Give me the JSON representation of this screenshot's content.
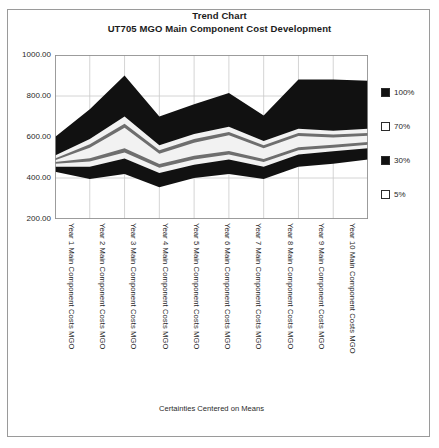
{
  "title": {
    "line1": "Trend Chart",
    "line2": "UT705 MGO Main Component Cost Development"
  },
  "footer": {
    "note": "Certainties Centered on Means"
  },
  "legend": {
    "items": [
      {
        "label": "100%",
        "fill": "#111111",
        "stroke": "#2b2b2b"
      },
      {
        "label": "70%",
        "fill": "#ffffff",
        "stroke": "#2b2b2b"
      },
      {
        "label": "30%",
        "fill": "#111111",
        "stroke": "#2b2b2b"
      },
      {
        "label": "5%",
        "fill": "#ffffff",
        "stroke": "#2b2b2b"
      }
    ]
  },
  "chart_data": {
    "type": "area",
    "subtitle": "Certainties Centered on Means",
    "xlabel": "",
    "ylabel": "",
    "ylim": [
      200.0,
      1000.0
    ],
    "yticks": [
      "1000.00",
      "800.00",
      "600.00",
      "400.00",
      "200.00"
    ],
    "ytick_values": [
      1000.0,
      800.0,
      600.0,
      400.0,
      200.0
    ],
    "grid": true,
    "legend_position": "right",
    "categories": [
      "Year 1 Main Component Costs MGO",
      "Year 2 Main Component Costs MGO",
      "Year 3 Main Component Costs MGO",
      "Year 4 Main Component Costs MGO",
      "Year 5 Main Component Costs MGO",
      "Year 6 Main Component Costs MGO",
      "Year 7 Main Component Costs MGO",
      "Year 8 Main Component Costs MGO",
      "Year 9 Main Component Costs MGO",
      "Year 10 Main Component Costs MGO"
    ],
    "bands": [
      {
        "name": "100%",
        "fill": "#111111",
        "upper": [
          600,
          735,
          900,
          700,
          760,
          815,
          705,
          880,
          880,
          875
        ],
        "lower": [
          430,
          395,
          420,
          355,
          400,
          420,
          395,
          455,
          470,
          490
        ]
      },
      {
        "name": "70%",
        "fill": "#f2f2f2",
        "upper": [
          510,
          590,
          700,
          560,
          615,
          650,
          580,
          640,
          630,
          640
        ],
        "lower": [
          455,
          455,
          495,
          425,
          465,
          490,
          455,
          515,
          530,
          545
        ]
      },
      {
        "name": "30%",
        "fill": "#6e6e6e",
        "upper": [
          495,
          565,
          665,
          535,
          590,
          625,
          560,
          620,
          612,
          620
        ],
        "lower": [
          470,
          480,
          525,
          450,
          490,
          515,
          478,
          535,
          548,
          562
        ]
      },
      {
        "name": "5%",
        "fill": "#f2f2f2",
        "upper": [
          486,
          548,
          645,
          518,
          572,
          608,
          545,
          605,
          598,
          606
        ],
        "lower": [
          478,
          496,
          545,
          468,
          508,
          532,
          493,
          550,
          562,
          576
        ]
      }
    ]
  }
}
